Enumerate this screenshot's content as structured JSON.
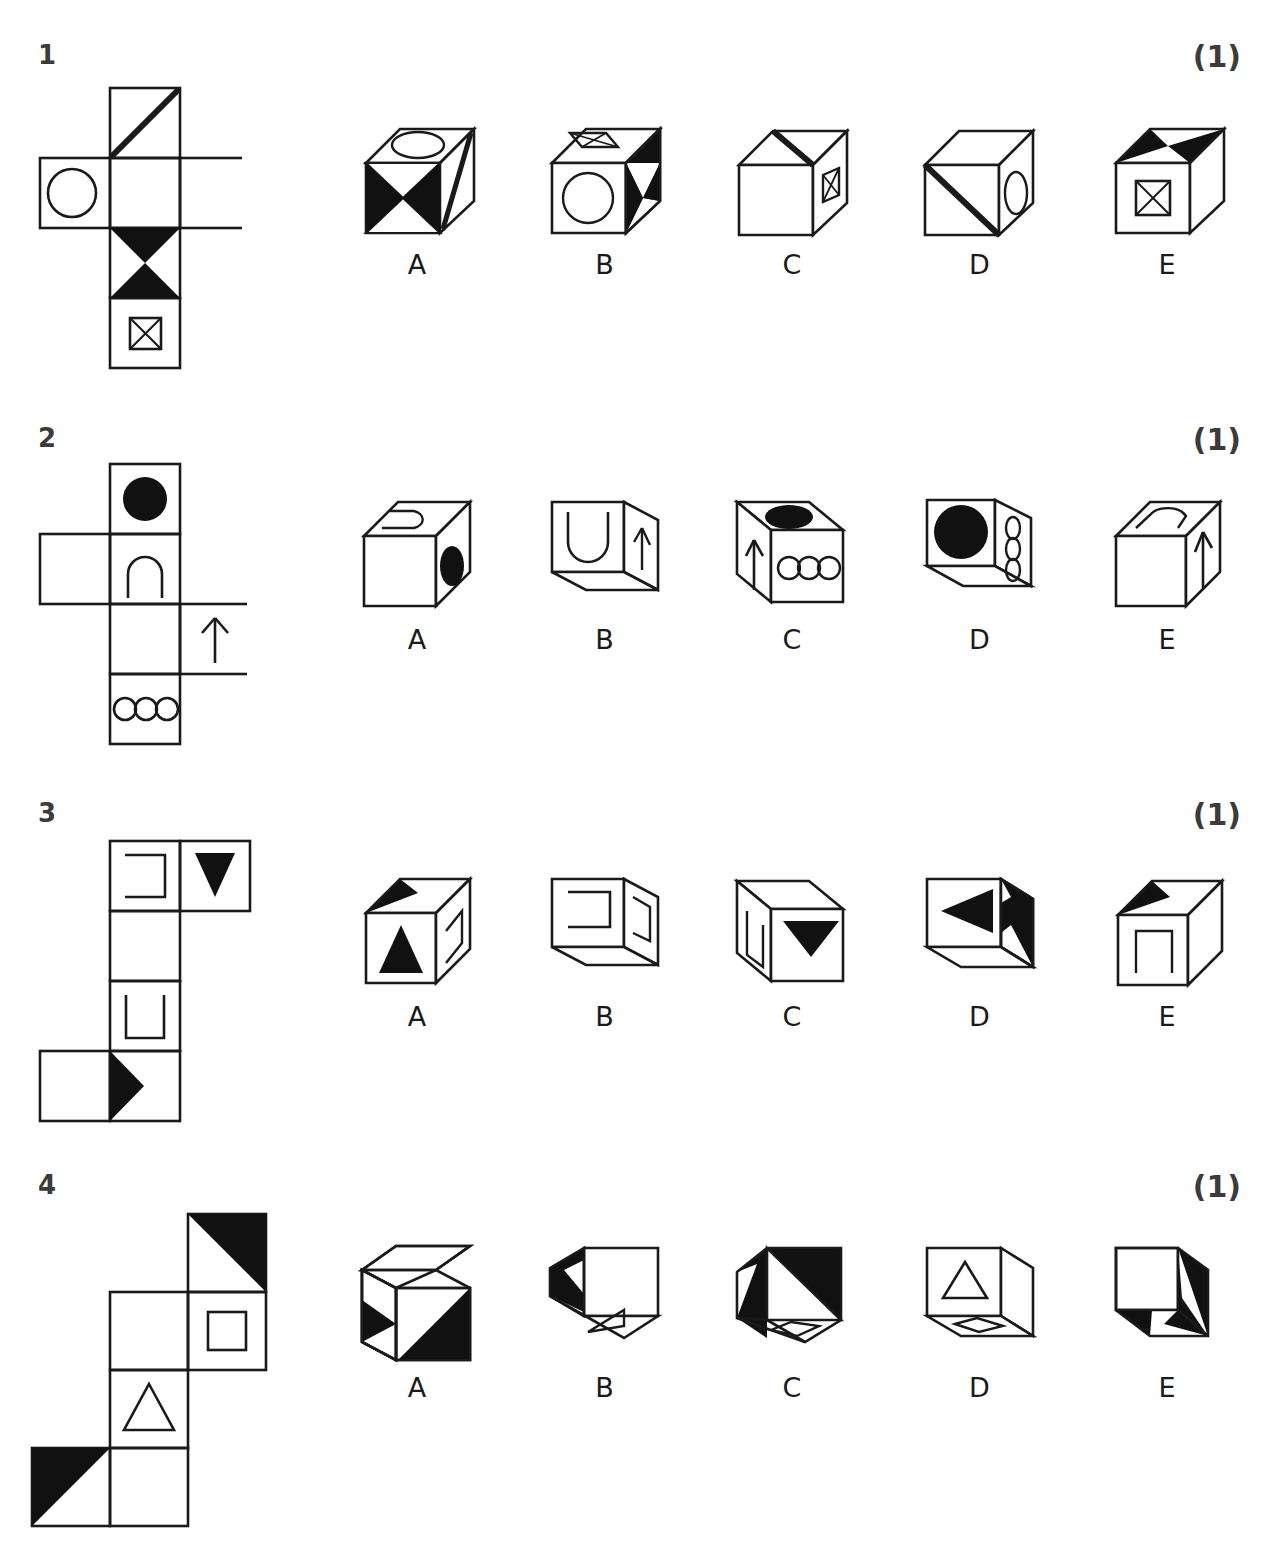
{
  "page": {
    "type": "spatial-reasoning-cube-folding-test",
    "questions": [
      {
        "number": "1",
        "mark": "(1)",
        "net": {
          "description": "cross-shaped net: vertical column of four squares with one square left and one square right of the second row",
          "cells": [
            {
              "col": 1,
              "row": 0,
              "symbol": "diagonal-thick-line-bottomleft-to-topright"
            },
            {
              "col": 0,
              "row": 1,
              "symbol": "circle-outline"
            },
            {
              "col": 1,
              "row": 1,
              "symbol": "blank"
            },
            {
              "col": 2,
              "row": 1,
              "symbol": "blank"
            },
            {
              "col": 1,
              "row": 2,
              "symbol": "black-hourglass-bowtie-vertical"
            },
            {
              "col": 1,
              "row": 3,
              "symbol": "square-with-x-cross"
            }
          ]
        },
        "options": [
          {
            "label": "A",
            "faces": "top: ellipse outline; front: four-triangle bowtie pattern black; right: diagonal line"
          },
          {
            "label": "B",
            "faces": "top: square-with-x; front: circle outline; right: black triangles"
          },
          {
            "label": "C",
            "faces": "top: diagonal thick line; front: blank; right: square-with-x"
          },
          {
            "label": "D",
            "faces": "front: thick diagonal line; right: ellipse outline; top: blank"
          },
          {
            "label": "E",
            "faces": "top: black bowtie triangles; front: square-with-x; right: blank"
          }
        ]
      },
      {
        "number": "2",
        "mark": "(1)",
        "net": {
          "description": "net: vertical column of four squares, one square left of row 2, one square right of row 3",
          "cells": [
            {
              "col": 1,
              "row": 0,
              "symbol": "black-filled-circle"
            },
            {
              "col": 0,
              "row": 1,
              "symbol": "blank"
            },
            {
              "col": 1,
              "row": 1,
              "symbol": "arch-inverted-u"
            },
            {
              "col": 1,
              "row": 2,
              "symbol": "blank"
            },
            {
              "col": 2,
              "row": 2,
              "symbol": "arrow-up"
            },
            {
              "col": 1,
              "row": 3,
              "symbol": "three-small-circles"
            }
          ]
        },
        "options": [
          {
            "label": "A",
            "faces": "top: arch shape; right: black ellipse; front: blank"
          },
          {
            "label": "B",
            "faces": "front: arch u-shape; right: arrow up; bottom visible"
          },
          {
            "label": "C",
            "faces": "left: arrow up; top: black ellipse; front: three circles"
          },
          {
            "label": "D",
            "faces": "front: black circle; right: three ellipses; bottom visible"
          },
          {
            "label": "E",
            "faces": "top: arch shape; right: arrow up; front: blank"
          }
        ]
      },
      {
        "number": "3",
        "mark": "(1)",
        "net": {
          "description": "net: vertical column of four squares, one square right of row 1, one square left of row 4",
          "cells": [
            {
              "col": 1,
              "row": 0,
              "symbol": "bracket-open-left"
            },
            {
              "col": 2,
              "row": 0,
              "symbol": "black-triangle-down"
            },
            {
              "col": 1,
              "row": 1,
              "symbol": "blank"
            },
            {
              "col": 1,
              "row": 2,
              "symbol": "bracket-u-open-top"
            },
            {
              "col": 0,
              "row": 3,
              "symbol": "blank"
            },
            {
              "col": 1,
              "row": 3,
              "symbol": "black-triangle-right"
            }
          ]
        },
        "options": [
          {
            "label": "A",
            "faces": "top: black triangle; front: black triangle up; right: bracket"
          },
          {
            "label": "B",
            "faces": "front: bracket open shape; right: bracket; bottom visible"
          },
          {
            "label": "C",
            "faces": "left: u-bracket; front: black triangle down; top: blank"
          },
          {
            "label": "D",
            "faces": "front: black triangle left; right: black triangle notch"
          },
          {
            "label": "E",
            "faces": "top: black triangle; front: inverted-u bracket; right: blank"
          }
        ]
      },
      {
        "number": "4",
        "mark": "(1)",
        "net": {
          "description": "staircase net: black triangle top right, two squares in middle row, triangle square, black triangle bottom left",
          "cells": [
            {
              "col": 2,
              "row": 0,
              "symbol": "black-triangle-upper-right-half"
            },
            {
              "col": 1,
              "row": 1,
              "symbol": "blank"
            },
            {
              "col": 2,
              "row": 1,
              "symbol": "small-square-outline"
            },
            {
              "col": 1,
              "row": 2,
              "symbol": "triangle-outline-up"
            },
            {
              "col": 0,
              "row": 3,
              "symbol": "black-triangle-upper-left-half"
            },
            {
              "col": 1,
              "row": 3,
              "symbol": "blank"
            }
          ]
        },
        "options": [
          {
            "label": "A",
            "faces": "left: black triangle; front: black triangle; top: blank"
          },
          {
            "label": "B",
            "faces": "left: black triangle; bottom: small triangle outline; front: blank"
          },
          {
            "label": "C",
            "faces": "left: black triangle; front: black diagonal half; bottom: square outline"
          },
          {
            "label": "D",
            "faces": "front: triangle outline; bottom: square outline; right: blank"
          },
          {
            "label": "E",
            "faces": "right: black triangle; bottom: black triangle; front: blank"
          }
        ]
      }
    ]
  }
}
